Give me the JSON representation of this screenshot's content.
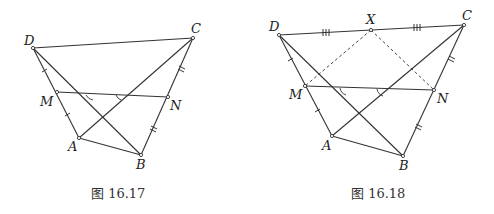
{
  "figures": [
    {
      "id": "fig1",
      "caption": "图 16.17",
      "points": {
        "D": {
          "label": "D",
          "x": 33,
          "y": 48,
          "lx": 24,
          "ly": 45
        },
        "C": {
          "label": "C",
          "x": 193,
          "y": 38,
          "lx": 191,
          "ly": 33
        },
        "M": {
          "label": "M",
          "x": 57,
          "y": 92,
          "lx": 40,
          "ly": 106
        },
        "N": {
          "label": "N",
          "x": 168,
          "y": 97,
          "lx": 170,
          "ly": 110
        },
        "A": {
          "label": "A",
          "x": 79,
          "y": 138,
          "lx": 68,
          "ly": 151
        },
        "B": {
          "label": "B",
          "x": 141,
          "y": 155,
          "lx": 136,
          "ly": 169
        }
      },
      "segments": [
        [
          "D",
          "C"
        ],
        [
          "D",
          "A"
        ],
        [
          "D",
          "B"
        ],
        [
          "A",
          "C"
        ],
        [
          "A",
          "B"
        ],
        [
          "B",
          "C"
        ],
        [
          "M",
          "N"
        ]
      ],
      "equal_marks": {
        "DM_MA": "single tick",
        "CN_NB": "double tick"
      },
      "angle_marks": [
        "angle between MN and DB",
        "angle between MN and AC"
      ]
    },
    {
      "id": "fig2",
      "caption": "图 16.18",
      "points": {
        "D": {
          "label": "D",
          "x": 279,
          "y": 35,
          "lx": 269,
          "ly": 31
        },
        "X": {
          "label": "X",
          "x": 371,
          "y": 30,
          "lx": 366,
          "ly": 24
        },
        "C": {
          "label": "C",
          "x": 464,
          "y": 25,
          "lx": 462,
          "ly": 20
        },
        "M": {
          "label": "M",
          "x": 305,
          "y": 86,
          "lx": 289,
          "ly": 99
        },
        "N": {
          "label": "N",
          "x": 434,
          "y": 90,
          "lx": 437,
          "ly": 103
        },
        "A": {
          "label": "A",
          "x": 332,
          "y": 136,
          "lx": 322,
          "ly": 150
        },
        "B": {
          "label": "B",
          "x": 403,
          "y": 156,
          "lx": 399,
          "ly": 170
        }
      },
      "segments": [
        [
          "D",
          "C"
        ],
        [
          "D",
          "A"
        ],
        [
          "D",
          "B"
        ],
        [
          "A",
          "C"
        ],
        [
          "A",
          "B"
        ],
        [
          "B",
          "C"
        ],
        [
          "M",
          "N"
        ]
      ],
      "dashed_segments": [
        [
          "X",
          "M"
        ],
        [
          "X",
          "N"
        ]
      ],
      "equal_marks": {
        "DX_XC": "triple tick",
        "DM_MA": "single tick",
        "CN_NB": "double tick"
      },
      "angle_marks": [
        "angle between MN and DB",
        "angle between MN and AC"
      ]
    }
  ]
}
